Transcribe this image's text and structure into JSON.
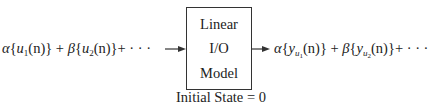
{
  "diagram": {
    "input": {
      "alpha": "α",
      "u1_open": "{",
      "u1_var": "u",
      "u1_sub": "1",
      "u1_arg": "(n)",
      "u1_close": "}",
      "plus": " + ",
      "beta": "β",
      "u2_open": "{",
      "u2_var": "u",
      "u2_sub": "2",
      "u2_arg": "(n)",
      "u2_close": "}",
      "tail": "+ · · ·"
    },
    "block": {
      "line1": "Linear",
      "line2": "I/O",
      "line3": "Model"
    },
    "output": {
      "alpha": "α",
      "y1_open": "{",
      "y1_var": "y",
      "y1_sub_var": "u",
      "y1_sub_sub": "1",
      "y1_arg": "(n)",
      "y1_close": "}",
      "plus": " + ",
      "beta": "β",
      "y2_open": "{",
      "y2_var": "y",
      "y2_sub_var": "u",
      "y2_sub_sub": "2",
      "y2_arg": "(n)",
      "y2_close": "}",
      "tail": "+ · · ·"
    },
    "initial_state": "Initial State = 0",
    "colors": {
      "stroke": "#333333",
      "text": "#222222",
      "background": "#ffffff"
    }
  }
}
